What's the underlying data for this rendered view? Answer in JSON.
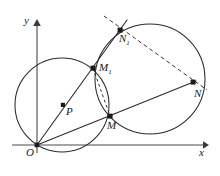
{
  "figure": {
    "kind": "geometry-diagram",
    "background": "#ffffff",
    "stroke_color": "#2b2b2b",
    "axis_color": "#4a4a4a",
    "width": 220,
    "height": 176
  },
  "axes": {
    "origin_label": "O",
    "x_label": "x",
    "y_label": "y",
    "origin": {
      "x": 37,
      "y": 145
    },
    "x_axis": {
      "x1": 12,
      "y1": 145,
      "x2": 205,
      "y2": 145
    },
    "y_axis": {
      "x1": 37,
      "y1": 152,
      "x2": 37,
      "y2": 20
    }
  },
  "points": [
    {
      "name": "O",
      "label": "O",
      "sub": "",
      "x": 37,
      "y": 145,
      "label_x": 28,
      "label_y": 148,
      "dot": true
    },
    {
      "name": "P",
      "label": "P",
      "sub": "",
      "x": 63,
      "y": 105,
      "label_x": 66,
      "label_y": 108,
      "dot": true
    },
    {
      "name": "M1",
      "label": "M",
      "sub": "1",
      "x": 93,
      "y": 68,
      "label_x": 99,
      "label_y": 65,
      "dot": true
    },
    {
      "name": "N1",
      "label": "N",
      "sub": "1",
      "x": 120,
      "y": 30,
      "label_x": 120,
      "label_y": 34,
      "dot": true
    },
    {
      "name": "M",
      "label": "M",
      "sub": "",
      "x": 110,
      "y": 116,
      "label_x": 109,
      "label_y": 121,
      "dot": true
    },
    {
      "name": "N",
      "label": "N",
      "sub": "",
      "x": 193,
      "y": 82,
      "label_x": 195,
      "label_y": 88,
      "dot": true
    }
  ],
  "circles": [
    {
      "name": "circle-P",
      "cx": 62,
      "cy": 105,
      "r": 47,
      "style": "solid"
    },
    {
      "name": "circle-big",
      "cx": 150,
      "cy": 79,
      "r": 55,
      "style": "solid"
    }
  ],
  "lines": [
    {
      "name": "ray-O-N1",
      "x1": 37,
      "y1": 145,
      "x2": 127,
      "y2": 20,
      "style": "solid"
    },
    {
      "name": "ray-O-N",
      "x1": 37,
      "y1": 145,
      "x2": 196,
      "y2": 81,
      "style": "solid"
    },
    {
      "name": "line-N1-N",
      "x1": 104,
      "y1": 16,
      "x2": 207,
      "y2": 90,
      "style": "dashed"
    },
    {
      "name": "chord-M1-M",
      "x1": 93,
      "y1": 68,
      "x2": 110,
      "y2": 116,
      "style": "dashed"
    }
  ]
}
